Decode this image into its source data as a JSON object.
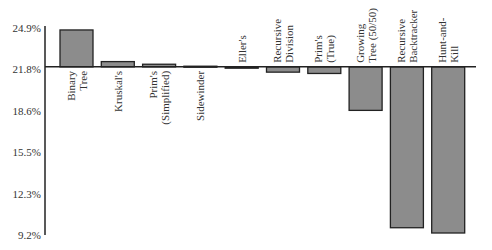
{
  "chart_data": {
    "type": "bar",
    "title": "",
    "xlabel": "",
    "ylabel": "",
    "baseline": 21.8,
    "ylim": [
      9.2,
      24.9
    ],
    "yticks": [
      "24.9%",
      "21.8%",
      "18.6%",
      "15.5%",
      "12.3%",
      "9.2%"
    ],
    "ytick_values": [
      24.9,
      21.8,
      18.6,
      15.5,
      12.3,
      9.2
    ],
    "grid": false,
    "legend": "none",
    "categories": [
      [
        "Binary",
        "Tree"
      ],
      [
        "Kruskal's"
      ],
      [
        "Prim's",
        "(Simplified)"
      ],
      [
        "Sidewinder"
      ],
      [
        "Eller's"
      ],
      [
        "Recursive",
        "Division"
      ],
      [
        "Prim's",
        "(True)"
      ],
      [
        "Growing",
        "Tree (50/50)"
      ],
      [
        "Recursive",
        "Backtracker"
      ],
      [
        "Hunt-and-",
        "Kill"
      ]
    ],
    "values": [
      24.6,
      22.2,
      22.0,
      21.85,
      21.7,
      21.4,
      21.3,
      18.5,
      9.6,
      9.2
    ],
    "colors": {
      "bar_fill": "#8c8c8c",
      "bar_stroke": "#222222",
      "axis": "#222222"
    }
  }
}
